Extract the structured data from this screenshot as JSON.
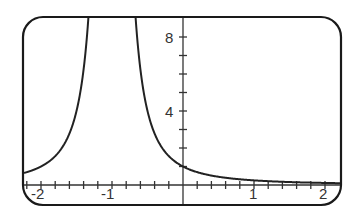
{
  "chart_data": {
    "type": "line",
    "title": "",
    "xlabel": "",
    "ylabel": "",
    "xlim": [
      -2.25,
      2.2
    ],
    "ylim": [
      -1.0,
      9.0
    ],
    "grid": false,
    "legend": null,
    "x_ticks": [
      -2,
      -1,
      1,
      2
    ],
    "x_minor_step": 0.2,
    "y_ticks": [
      4,
      8
    ],
    "y_minor_step": 1,
    "series": [
      {
        "name": "y = 1/(x+1)^2",
        "vertical_asymptote": -1,
        "x": [
          -2.2,
          -2.0,
          -1.8,
          -1.6,
          -1.4,
          -1.35,
          -1.3,
          -1.0,
          -0.7,
          -0.65,
          -0.6,
          -0.4,
          -0.2,
          0,
          0.5,
          1.0,
          1.5,
          2.0,
          2.2
        ],
        "y": [
          0.69,
          1.0,
          1.56,
          2.78,
          6.25,
          8.16,
          11.1,
          null,
          11.1,
          8.16,
          6.25,
          2.78,
          1.56,
          1.0,
          0.44,
          0.25,
          0.16,
          0.11,
          0.1
        ]
      }
    ],
    "annotations": []
  },
  "labels": {
    "x": [
      "-2",
      "-1",
      "1",
      "2"
    ],
    "y": [
      "8",
      "4"
    ]
  },
  "colors": {
    "frame": "#1a1a1a",
    "curve": "#222222",
    "axis": "#333333",
    "text": "#333333"
  }
}
